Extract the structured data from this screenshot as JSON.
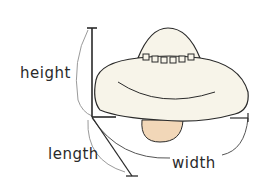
{
  "diagram": {
    "labels": {
      "height": "height",
      "length": "length",
      "width": "width"
    },
    "colors": {
      "body_fill": "#f7f4e9",
      "pod_fill": "#f2d7b8",
      "stroke": "#2a2a2a",
      "guide": "#9a9a9a"
    },
    "window_count": 6
  }
}
